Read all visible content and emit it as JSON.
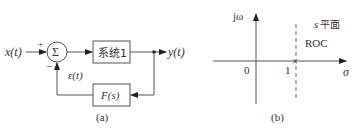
{
  "diagram_a": {
    "caption": "(a)",
    "input_label": "x(t)",
    "output_label": "y(t)",
    "sum_symbol": "Σ",
    "plus_sign": "+",
    "minus_sign": "−",
    "error_label": "ε(t)",
    "forward_block": "系统1",
    "feedback_block": "F(s)"
  },
  "diagram_b": {
    "caption": "(b)",
    "vertical_axis_label": "jω",
    "horizontal_axis_label": "σ",
    "plane_label_var": "s",
    "plane_label_text": "平面",
    "region_label": "ROC",
    "origin_tick": "0",
    "boundary_tick": "1",
    "pole_marker": "×"
  }
}
